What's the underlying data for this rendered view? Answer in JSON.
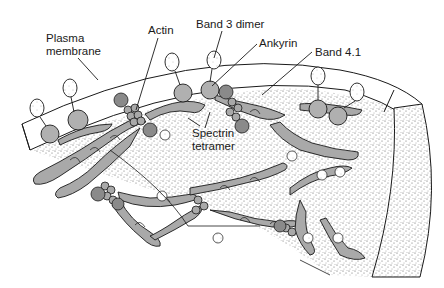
{
  "figure": {
    "labels": {
      "plasma_membrane_line1": "Plasma",
      "plasma_membrane_line2": "membrane",
      "actin": "Actin",
      "band3_dimer": "Band 3 dimer",
      "ankyrin": "Ankyrin",
      "band41": "Band 4.1",
      "spectrin_line1": "Spectrin",
      "spectrin_line2": "tetramer"
    },
    "colors": {
      "background": "#ffffff",
      "line": "#1a1a1a",
      "protein_fill": "#a9a9a9",
      "protein_dark": "#8a8a8a",
      "stipple": "#6b6b6b",
      "membrane_fill": "#ffffff"
    }
  }
}
